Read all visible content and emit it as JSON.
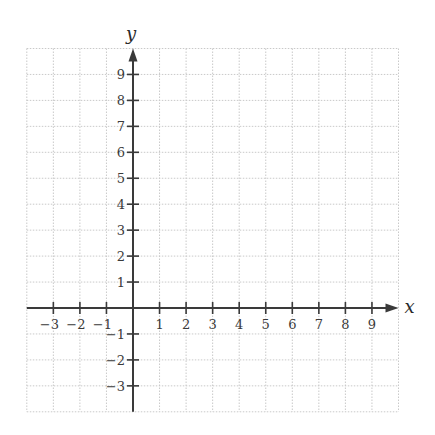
{
  "chart_data": {
    "type": "scatter",
    "title": "",
    "xlabel": "x",
    "ylabel": "y",
    "xlim": [
      -4,
      10
    ],
    "ylim": [
      -4,
      10
    ],
    "grid": true,
    "grid_style": "dotted",
    "x_ticks": [
      -3,
      -2,
      -1,
      1,
      2,
      3,
      4,
      5,
      6,
      7,
      8,
      9
    ],
    "y_ticks": [
      -3,
      -2,
      -1,
      1,
      2,
      3,
      4,
      5,
      6,
      7,
      8,
      9
    ],
    "x_tick_labels": [
      "−3",
      "−2",
      "−1",
      "1",
      "2",
      "3",
      "4",
      "5",
      "6",
      "7",
      "8",
      "9"
    ],
    "y_tick_labels": [
      "−3",
      "−2",
      "−1",
      "1",
      "2",
      "3",
      "4",
      "5",
      "6",
      "7",
      "8",
      "9"
    ],
    "series": [],
    "legend": null
  },
  "colors": {
    "axis": "#3a3a3a",
    "grid": "#c9c9c9",
    "background": "#ffffff"
  }
}
